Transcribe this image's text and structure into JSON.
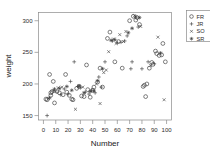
{
  "chart_data": {
    "type": "scatter",
    "title": "",
    "xlabel": "Number",
    "ylabel": "weight",
    "xlim": [
      -4,
      104
    ],
    "ylim": [
      143,
      313
    ],
    "xticks": [
      0,
      10,
      20,
      30,
      40,
      50,
      60,
      70,
      80,
      90,
      100
    ],
    "yticks": [
      150,
      200,
      250,
      300
    ],
    "grid": false,
    "legend_position": "right outside, top",
    "series": [
      {
        "name": "FR",
        "marker": "open-circle",
        "points": [
          [
            2,
            176
          ],
          [
            3,
            175
          ],
          [
            5,
            215
          ],
          [
            6,
            186
          ],
          [
            6,
            182
          ],
          [
            7,
            188
          ],
          [
            8,
            204
          ],
          [
            9,
            170
          ],
          [
            11,
            188
          ],
          [
            13,
            186
          ],
          [
            16,
            183
          ],
          [
            18,
            215
          ],
          [
            19,
            187
          ],
          [
            21,
            182
          ],
          [
            23,
            176
          ],
          [
            24,
            175
          ],
          [
            27,
            193
          ],
          [
            29,
            196
          ],
          [
            31,
            181
          ],
          [
            33,
            180
          ],
          [
            35,
            230
          ],
          [
            36,
            191
          ],
          [
            38,
            179
          ],
          [
            40,
            190
          ],
          [
            41,
            195
          ],
          [
            44,
            203
          ],
          [
            46,
            225
          ],
          [
            48,
            195
          ],
          [
            52,
            272
          ],
          [
            54,
            282
          ],
          [
            58,
            235
          ],
          [
            61,
            267
          ],
          [
            64,
            225
          ],
          [
            70,
            300
          ],
          [
            73,
            307
          ],
          [
            75,
            301
          ],
          [
            76,
            305
          ],
          [
            78,
            294
          ],
          [
            81,
            196
          ],
          [
            82,
            198
          ],
          [
            83,
            180
          ],
          [
            84,
            200
          ],
          [
            86,
            225
          ],
          [
            88,
            234
          ],
          [
            89,
            231
          ],
          [
            91,
            252
          ],
          [
            92,
            248
          ],
          [
            94,
            245
          ],
          [
            96,
            246
          ],
          [
            97,
            264
          ],
          [
            99,
            235
          ]
        ]
      },
      {
        "name": "JR",
        "marker": "plus",
        "points": [
          [
            3,
            150
          ],
          [
            8,
            189
          ],
          [
            14,
            183
          ],
          [
            17,
            192
          ],
          [
            20,
            184
          ],
          [
            22,
            204
          ],
          [
            25,
            235
          ],
          [
            28,
            196
          ],
          [
            30,
            194
          ],
          [
            34,
            187
          ],
          [
            37,
            184
          ],
          [
            39,
            190
          ],
          [
            42,
            186
          ],
          [
            45,
            211
          ],
          [
            47,
            195
          ],
          [
            50,
            235
          ],
          [
            56,
            268
          ],
          [
            60,
            265
          ],
          [
            63,
            266
          ],
          [
            66,
            268
          ],
          [
            68,
            276
          ],
          [
            71,
            224
          ],
          [
            72,
            235
          ],
          [
            77,
            290
          ],
          [
            80,
            224
          ],
          [
            85,
            235
          ],
          [
            90,
            232
          ]
        ]
      },
      {
        "name": "SO",
        "marker": "cross",
        "points": [
          [
            4,
            177
          ],
          [
            10,
            188
          ],
          [
            12,
            194
          ],
          [
            15,
            195
          ],
          [
            26,
            160
          ],
          [
            32,
            195
          ],
          [
            43,
            200
          ],
          [
            46,
            169
          ],
          [
            49,
            218
          ],
          [
            51,
            222
          ],
          [
            53,
            251
          ],
          [
            57,
            271
          ],
          [
            59,
            264
          ],
          [
            62,
            278
          ],
          [
            65,
            267
          ],
          [
            67,
            283
          ],
          [
            74,
            308
          ],
          [
            79,
            291
          ],
          [
            87,
            229
          ],
          [
            93,
            274
          ],
          [
            98,
            175
          ]
        ]
      },
      {
        "name": "SR",
        "marker": "star",
        "points": [
          [
            5,
            178
          ],
          [
            9,
            192
          ],
          [
            13,
            193
          ],
          [
            19,
            196
          ],
          [
            23,
            190
          ],
          [
            29,
            197
          ],
          [
            33,
            186
          ],
          [
            38,
            188
          ],
          [
            41,
            189
          ],
          [
            44,
            205
          ],
          [
            48,
            224
          ],
          [
            55,
            269
          ],
          [
            58,
            270
          ],
          [
            69,
            281
          ],
          [
            72,
            288
          ],
          [
            75,
            306
          ],
          [
            78,
            305
          ],
          [
            95,
            249
          ]
        ]
      }
    ]
  },
  "axes": {
    "x_title": "Number",
    "y_title": "weight",
    "x_tick_labels": [
      "0",
      "10",
      "20",
      "30",
      "40",
      "50",
      "60",
      "70",
      "80",
      "90",
      "100"
    ],
    "y_tick_labels": [
      "150",
      "200",
      "250",
      "300"
    ]
  },
  "legend": {
    "entries": [
      {
        "label": "FR",
        "marker": "open-circle"
      },
      {
        "label": "JR",
        "marker": "plus"
      },
      {
        "label": "SO",
        "marker": "cross"
      },
      {
        "label": "SR",
        "marker": "star"
      }
    ]
  },
  "colors": {
    "background": "#ffffff",
    "axis": "#8a8a8a",
    "marker": "#3a3a3a",
    "text": "#2b2b2b"
  }
}
